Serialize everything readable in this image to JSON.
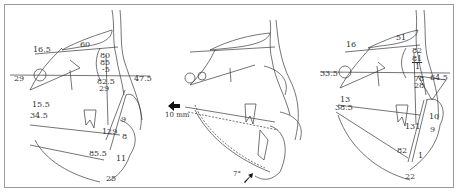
{
  "figure": {
    "panels": [
      {
        "id": "pre",
        "labels": {
          "sn_angle": "16.5",
          "palatal": "60",
          "sna": "80",
          "snb": "85",
          "anb": "-5",
          "gonial": "82.5",
          "fh": "29",
          "facial_plane": "47.5",
          "apdi": "29",
          "mp_left_1": "15.5",
          "mp_left_2": "34.5",
          "impa": "129",
          "incisor_1": "9",
          "incisor_2": "8",
          "lower_1": "85.5",
          "lower_2": "11",
          "chin": "25"
        }
      },
      {
        "id": "superimposition",
        "labels": {
          "movement": "10 mm",
          "rotation": "7°"
        }
      },
      {
        "id": "post",
        "labels": {
          "sn_angle": "16",
          "palatal": "51",
          "sna": "82",
          "snb": "81",
          "anb": "1",
          "fh": "33.5",
          "gonial": "78",
          "apdi": "28",
          "facial_plane": "64.5",
          "mp_left_1": "13",
          "mp_left_2": "38.5",
          "impa": "131",
          "incisor_1": "10",
          "incisor_2": "9",
          "lower_1": "82",
          "lower_2": "1",
          "chin": "22"
        }
      }
    ]
  },
  "colors": {
    "line": "#3a3a3a",
    "border": "#9a9a9a",
    "background": "#ffffff"
  }
}
